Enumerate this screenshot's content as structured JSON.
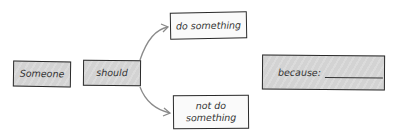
{
  "diagram": {
    "nodes": [
      {
        "id": "someone",
        "label": "Someone",
        "fill": "#d3d3d3"
      },
      {
        "id": "should",
        "label": "should",
        "fill": "#d3d3d3"
      },
      {
        "id": "do",
        "label": "do something",
        "fill": "#fafafa"
      },
      {
        "id": "notdo",
        "label": "not do something",
        "fill": "#fafafa"
      },
      {
        "id": "because",
        "label": "because:",
        "fill": "#d3d3d3",
        "has_blank": true
      }
    ],
    "edges": [
      {
        "from": "should",
        "to": "do"
      },
      {
        "from": "should",
        "to": "notdo"
      }
    ]
  }
}
